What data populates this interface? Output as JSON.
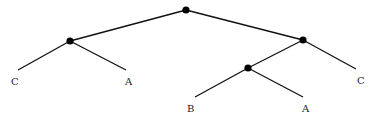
{
  "diagram": {
    "type": "tree",
    "colors": {
      "edge": "#111111",
      "node": "#000000",
      "label": "#222222",
      "background": "#ffffff"
    },
    "nodes": [
      {
        "id": "root",
        "x": 186,
        "y": 10,
        "internal": true
      },
      {
        "id": "n1",
        "x": 70,
        "y": 41,
        "internal": true
      },
      {
        "id": "n2",
        "x": 303,
        "y": 40,
        "internal": true
      },
      {
        "id": "n3",
        "x": 248,
        "y": 68,
        "internal": true
      },
      {
        "id": "leaf1",
        "x": 18,
        "y": 70,
        "label": "C"
      },
      {
        "id": "leaf2",
        "x": 126,
        "y": 70,
        "label": "A"
      },
      {
        "id": "leaf3",
        "x": 195,
        "y": 97,
        "label": "B"
      },
      {
        "id": "leaf4",
        "x": 303,
        "y": 97,
        "label": "A"
      },
      {
        "id": "leaf5",
        "x": 356,
        "y": 69,
        "label": "C"
      }
    ],
    "edges": [
      [
        "root",
        "n1"
      ],
      [
        "root",
        "n2"
      ],
      [
        "n1",
        "leaf1"
      ],
      [
        "n1",
        "leaf2"
      ],
      [
        "n2",
        "n3"
      ],
      [
        "n2",
        "leaf5"
      ],
      [
        "n3",
        "leaf3"
      ],
      [
        "n3",
        "leaf4"
      ]
    ],
    "labels": {
      "leaf1": "C",
      "leaf2": "A",
      "leaf3": "B",
      "leaf4": "A",
      "leaf5": "C"
    }
  }
}
